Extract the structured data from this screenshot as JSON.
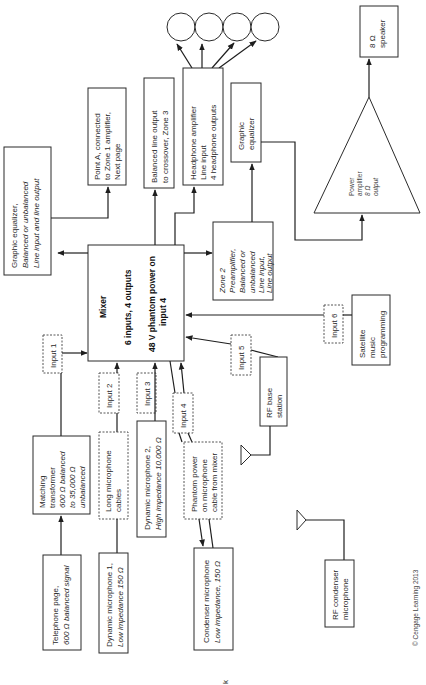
{
  "diagram": {
    "orientation": "rotated-90-ccw",
    "nodes": {
      "mixer": {
        "title": "Mixer",
        "line1": "6 inputs, 4 outputs",
        "line2": "48 V phantom power on",
        "line3": "input 4"
      },
      "graphic_eq_main": {
        "line1": "Graphic equalizer,",
        "line2": "Balanced or unbalanced",
        "line3": "Line input and line output"
      },
      "point_a": {
        "line1": "Point A, connected",
        "line2": "to Zone 1 amplifier,",
        "line3": "Next page"
      },
      "balanced_line_out": {
        "line1": "Balanced line output",
        "line2": "to crossover, Zone 3"
      },
      "headphone_amp": {
        "line1": "Headphone amplifier",
        "line2": "Line input",
        "line3": "4 headphone outputs"
      },
      "graphic_eq_zone2": {
        "line1": "Graphic",
        "line2": "equalizer"
      },
      "zone2_preamp": {
        "line1": "Zone 2",
        "line2": "Preamplifier,",
        "line3": "Balanced or",
        "line4": "unbalanced",
        "line5": "Line input,",
        "line6": "Line output"
      },
      "power_amp": {
        "line1": "Power",
        "line2": "amplifier",
        "line3": "8 Ω",
        "line4": "output"
      },
      "speaker": {
        "line1": "8 Ω",
        "line2": "speaker"
      },
      "satellite": {
        "line1": "Satellite",
        "line2": "music",
        "line3": "programming"
      },
      "rf_base": {
        "line1": "RF base",
        "line2": "station"
      },
      "rf_condenser": {
        "line1": "RF condenser",
        "line2": "microphone"
      },
      "matching_transformer": {
        "line1": "Matching",
        "line2": "transformer",
        "line3": "600 Ω balanced",
        "line4": "to 35,000 Ω",
        "line5": "unbalanced"
      },
      "telephone_page": {
        "line1": "Telephone page,",
        "line2": "600 Ω balanced signal"
      },
      "long_mic_cables": {
        "line1": "Long microphone",
        "line2": "cables"
      },
      "dynamic_mic_1": {
        "line1": "Dynamic microphone 1,",
        "line2": "Low impedance 150 Ω"
      },
      "dynamic_mic_2": {
        "line1": "Dynamic microphone 2,",
        "line2": "High impedance 10,000 Ω"
      },
      "phantom_cable": {
        "line1": "Phantom power",
        "line2": "on microphone",
        "line3": "cable from mixer"
      },
      "condenser_mic": {
        "line1": "Condenser microphone",
        "line2": "Low impedance, 150 Ω"
      }
    },
    "inputs": [
      "Input 1",
      "Input 2",
      "Input 3",
      "Input 4",
      "Input 5",
      "Input 6"
    ],
    "headphones_count": 4,
    "copyright": "© Cengage Learning 2013",
    "stray_mark": "k"
  }
}
